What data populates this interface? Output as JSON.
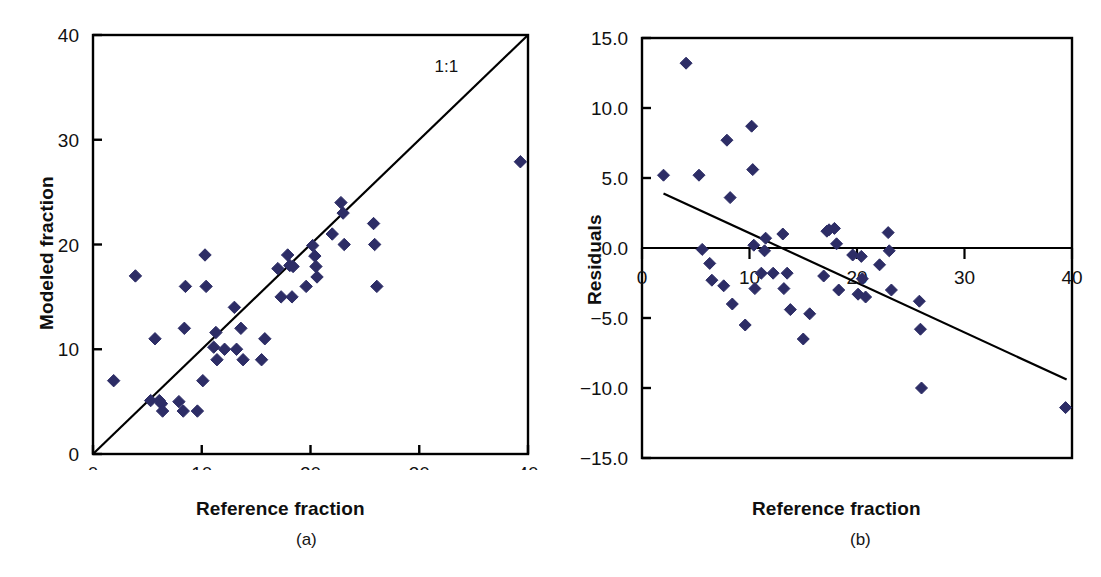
{
  "figure": {
    "panels": [
      {
        "id": "a",
        "subcaption": "(a)",
        "xlabel": "Reference fraction",
        "ylabel": "Modeled fraction",
        "annotation": "1:1"
      },
      {
        "id": "b",
        "subcaption": "(b)",
        "xlabel": "Reference fraction",
        "ylabel": "Residuals",
        "annotation": ""
      }
    ]
  },
  "style": {
    "marker_color": "#2d2d66",
    "axis_color": "#000000",
    "line_color": "#000000",
    "background": "#ffffff"
  },
  "chart_data": [
    {
      "type": "scatter",
      "panel": "a",
      "title": "",
      "xlabel": "Reference fraction",
      "ylabel": "Modeled fraction",
      "xlim": [
        0,
        40
      ],
      "ylim": [
        0,
        40
      ],
      "xticks": [
        0,
        10,
        20,
        30,
        40
      ],
      "yticks": [
        0,
        10,
        20,
        30,
        40
      ],
      "xtick_labels": [
        "0",
        "10",
        "20",
        "30",
        "40"
      ],
      "ytick_labels": [
        "0",
        "10",
        "20",
        "30",
        "40"
      ],
      "grid": false,
      "legend": false,
      "annotations": [
        {
          "text": "1:1",
          "x": 32.5,
          "y": 36.5
        }
      ],
      "reference_line": {
        "label": "1:1",
        "type": "identity",
        "x": [
          0,
          40
        ],
        "y": [
          0,
          40
        ]
      },
      "series": [
        {
          "name": "Modeled vs reference fraction",
          "marker": "diamond",
          "color": "#2d2d66",
          "points": [
            [
              1.9,
              7.0
            ],
            [
              3.9,
              17.0
            ],
            [
              5.3,
              5.1
            ],
            [
              5.7,
              11.0
            ],
            [
              6.1,
              5.1
            ],
            [
              6.3,
              4.8
            ],
            [
              6.4,
              4.1
            ],
            [
              7.9,
              5.0
            ],
            [
              8.3,
              4.1
            ],
            [
              8.4,
              12.0
            ],
            [
              8.5,
              16.0
            ],
            [
              9.6,
              4.1
            ],
            [
              10.1,
              7.0
            ],
            [
              10.3,
              19.0
            ],
            [
              10.4,
              16.0
            ],
            [
              11.1,
              10.2
            ],
            [
              11.3,
              11.6
            ],
            [
              11.4,
              9.0
            ],
            [
              12.1,
              10.0
            ],
            [
              13.0,
              14.0
            ],
            [
              13.2,
              10.0
            ],
            [
              13.6,
              12.0
            ],
            [
              13.8,
              9.0
            ],
            [
              15.5,
              9.0
            ],
            [
              15.8,
              11.0
            ],
            [
              17.0,
              17.7
            ],
            [
              17.3,
              15.0
            ],
            [
              17.9,
              19.0
            ],
            [
              18.1,
              18.0
            ],
            [
              18.3,
              15.0
            ],
            [
              18.4,
              17.9
            ],
            [
              19.6,
              16.0
            ],
            [
              20.2,
              19.9
            ],
            [
              20.4,
              18.9
            ],
            [
              20.5,
              17.9
            ],
            [
              20.6,
              16.9
            ],
            [
              22.0,
              21.0
            ],
            [
              22.8,
              24.0
            ],
            [
              23.0,
              23.0
            ],
            [
              23.1,
              20.0
            ],
            [
              25.8,
              22.0
            ],
            [
              25.9,
              20.0
            ],
            [
              26.1,
              16.0
            ],
            [
              39.3,
              27.9
            ]
          ]
        }
      ]
    },
    {
      "type": "scatter",
      "panel": "b",
      "title": "",
      "xlabel": "Reference fraction",
      "ylabel": "Residuals",
      "xlim": [
        0,
        40
      ],
      "ylim": [
        -15.0,
        15.0
      ],
      "xticks": [
        0,
        10,
        20,
        30,
        40
      ],
      "yticks": [
        -15.0,
        -10.0,
        -5.0,
        0.0,
        5.0,
        10.0,
        15.0
      ],
      "xtick_labels": [
        "0",
        "10",
        "20",
        "30",
        "40"
      ],
      "ytick_labels": [
        "−15.0",
        "−10.0",
        "−5.0",
        "0.0",
        "5.0",
        "10.0",
        "15.0"
      ],
      "grid": false,
      "legend": false,
      "zero_line": 0.0,
      "trend_line": {
        "x": [
          2.0,
          39.5
        ],
        "y": [
          3.9,
          -9.4
        ]
      },
      "series": [
        {
          "name": "Residuals vs reference fraction",
          "marker": "diamond",
          "color": "#2d2d66",
          "points": [
            [
              2.0,
              5.2
            ],
            [
              4.1,
              13.2
            ],
            [
              5.3,
              5.2
            ],
            [
              5.6,
              -0.1
            ],
            [
              6.3,
              -1.1
            ],
            [
              6.5,
              -2.3
            ],
            [
              7.6,
              -2.7
            ],
            [
              7.9,
              7.7
            ],
            [
              8.2,
              3.6
            ],
            [
              8.4,
              -4.0
            ],
            [
              9.6,
              -5.5
            ],
            [
              10.2,
              8.7
            ],
            [
              10.3,
              5.6
            ],
            [
              10.4,
              0.2
            ],
            [
              10.5,
              -2.9
            ],
            [
              11.1,
              -1.8
            ],
            [
              11.4,
              -0.2
            ],
            [
              11.5,
              0.7
            ],
            [
              12.2,
              -1.8
            ],
            [
              13.1,
              1.0
            ],
            [
              13.2,
              -2.9
            ],
            [
              13.5,
              -1.8
            ],
            [
              13.8,
              -4.4
            ],
            [
              15.0,
              -6.5
            ],
            [
              15.6,
              -4.7
            ],
            [
              16.9,
              -2.0
            ],
            [
              17.2,
              1.2
            ],
            [
              17.4,
              1.3
            ],
            [
              17.9,
              1.4
            ],
            [
              18.1,
              0.3
            ],
            [
              18.3,
              -3.0
            ],
            [
              19.6,
              -0.5
            ],
            [
              20.1,
              -3.3
            ],
            [
              20.4,
              -0.6
            ],
            [
              20.5,
              -2.2
            ],
            [
              20.8,
              -3.5
            ],
            [
              22.1,
              -1.2
            ],
            [
              22.9,
              1.1
            ],
            [
              23.0,
              -0.2
            ],
            [
              23.2,
              -3.0
            ],
            [
              25.8,
              -3.8
            ],
            [
              25.9,
              -5.8
            ],
            [
              26.0,
              -10.0
            ],
            [
              39.4,
              -11.4
            ]
          ]
        }
      ]
    }
  ]
}
